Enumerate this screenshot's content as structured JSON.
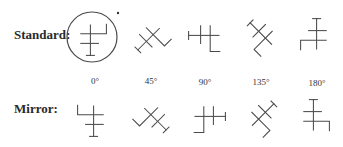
{
  "labels": {
    "standard": "Standard:",
    "mirror": "Mirror:"
  },
  "angles": [
    "0°",
    "45°",
    "90°",
    "135°",
    "180°"
  ],
  "figure": {
    "columns": [
      {
        "angle": "0°",
        "x": 92
      },
      {
        "angle": "45°",
        "x": 152
      },
      {
        "angle": "90°",
        "x": 207
      },
      {
        "angle": "135°",
        "x": 262
      },
      {
        "angle": "180°",
        "x": 315
      }
    ],
    "standard_row_y": 37,
    "mirror_row_y": 118,
    "highlight": {
      "shape": "circle",
      "column": "0°",
      "row": "standard",
      "marker": "dot"
    },
    "stroke_color": "#4a4a4a"
  }
}
